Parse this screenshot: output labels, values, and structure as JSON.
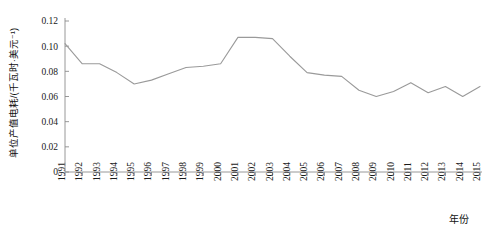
{
  "chart_data": {
    "type": "line",
    "title": "",
    "xlabel": "年份",
    "ylabel": "单位产值电耗/(千瓦时·美元⁻¹)",
    "xlim": [
      1991,
      2015
    ],
    "ylim": [
      0,
      0.12
    ],
    "grid": false,
    "legend": null,
    "ytick_labels": [
      "0",
      "0.02",
      "0.04",
      "0.06",
      "0.08",
      "0.10",
      "0.12"
    ],
    "ytick_values": [
      0,
      0.02,
      0.04,
      0.06,
      0.08,
      0.1,
      0.12
    ],
    "categories": [
      "1991",
      "1992",
      "1993",
      "1994",
      "1995",
      "1996",
      "1997",
      "1998",
      "1999",
      "2000",
      "2001",
      "2002",
      "2003",
      "2004",
      "2005",
      "2006",
      "2007",
      "2008",
      "2009",
      "2010",
      "2011",
      "2012",
      "2013",
      "2014",
      "2015"
    ],
    "series": [
      {
        "name": "单位产值电耗",
        "values": [
          0.102,
          0.086,
          0.086,
          0.079,
          0.07,
          0.073,
          0.078,
          0.083,
          0.084,
          0.086,
          0.107,
          0.107,
          0.106,
          0.092,
          0.079,
          0.077,
          0.076,
          0.065,
          0.06,
          0.064,
          0.071,
          0.063,
          0.068,
          0.06,
          0.068
        ]
      }
    ],
    "line_color": "#9a9a9a",
    "axis_color": "#8c8c8c"
  },
  "axis": {
    "y_title": "单位产值电耗/(千瓦时·美元⁻¹)",
    "x_title": "年份"
  }
}
